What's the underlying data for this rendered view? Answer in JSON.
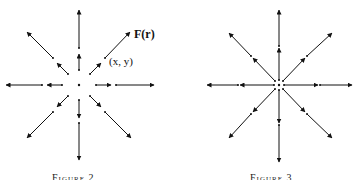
{
  "figures": [
    {
      "id": "left",
      "caption": "Figure 2",
      "center": [
        79,
        85
      ],
      "labels": {
        "force": "F(r)",
        "point": "(x, y)"
      },
      "arrows": [
        [
          79,
          70,
          79,
          54
        ],
        [
          79,
          48,
          79,
          10
        ],
        [
          96,
          85,
          111,
          85
        ],
        [
          116,
          85,
          154,
          85
        ],
        [
          62,
          85,
          47,
          85
        ],
        [
          42,
          85,
          6,
          85
        ],
        [
          90,
          74,
          101,
          63
        ],
        [
          105,
          58,
          130,
          32
        ],
        [
          68,
          74,
          57,
          63
        ],
        [
          53,
          58,
          27,
          32
        ],
        [
          90,
          96,
          101,
          107
        ],
        [
          105,
          112,
          131,
          138
        ],
        [
          68,
          96,
          57,
          107
        ],
        [
          53,
          112,
          27,
          138
        ],
        [
          79,
          100,
          79,
          118
        ],
        [
          79,
          123,
          79,
          160
        ]
      ]
    },
    {
      "id": "right",
      "caption": "Figure 3",
      "center": [
        279,
        85
      ],
      "arrows": [
        [
          279,
          80,
          279,
          48
        ],
        [
          279,
          46,
          279,
          10
        ],
        [
          279,
          90,
          279,
          123
        ],
        [
          279,
          125,
          279,
          162
        ],
        [
          284,
          85,
          318,
          85
        ],
        [
          320,
          85,
          352,
          85
        ],
        [
          274,
          85,
          240,
          85
        ],
        [
          238,
          85,
          207,
          85
        ],
        [
          283,
          81,
          305,
          58
        ],
        [
          307,
          56,
          332,
          33
        ],
        [
          275,
          81,
          253,
          58
        ],
        [
          251,
          56,
          229,
          33
        ],
        [
          283,
          89,
          305,
          112
        ],
        [
          307,
          114,
          332,
          138
        ],
        [
          275,
          89,
          253,
          112
        ],
        [
          251,
          114,
          229,
          138
        ]
      ]
    }
  ],
  "colors": {
    "ink": "#111111",
    "background": "#ffffff"
  }
}
